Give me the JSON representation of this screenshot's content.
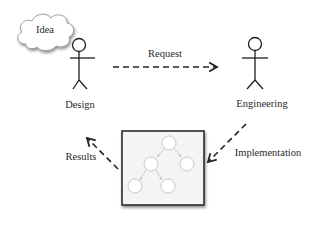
{
  "diagram": {
    "cloud": {
      "label": "Idea"
    },
    "actors": [
      {
        "id": "design",
        "label": "Design"
      },
      {
        "id": "engineering",
        "label": "Engineering"
      }
    ],
    "edges": [
      {
        "from": "Design",
        "to": "Engineering",
        "label": "Request",
        "style": "dashed"
      },
      {
        "from": "Engineering",
        "to": "Implementation box",
        "label": "Implementation",
        "style": "dashed"
      },
      {
        "from": "Implementation box",
        "to": "Design",
        "label": "Results",
        "style": "dashed"
      }
    ],
    "box": {
      "content": "tree graph (5 nodes)"
    }
  },
  "colors": {
    "line": "#222222",
    "box_fill": "#f3f3f3",
    "node_stroke": "#c8c8c8",
    "node_arrow": "#bdbdbd"
  }
}
